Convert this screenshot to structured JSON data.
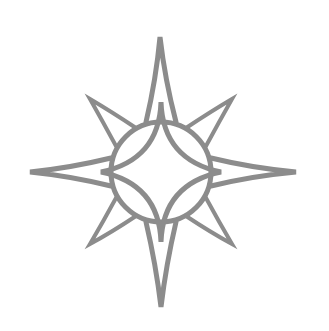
{
  "image": {
    "subject": "compass star / sun emblem",
    "background": "#ffffff",
    "stroke_color": "#8c8c8c",
    "center": [
      161,
      172
    ],
    "circle_radius": 50,
    "main_points": {
      "top": [
        160,
        37
      ],
      "right": [
        296,
        172
      ],
      "bottom": [
        161,
        307
      ],
      "left": [
        30,
        172
      ]
    },
    "diagonal_points": {
      "top_left": [
        90,
        99
      ],
      "top_right": [
        232,
        99
      ],
      "bottom_right": [
        232,
        244
      ],
      "bottom_left": [
        90,
        244
      ]
    }
  }
}
